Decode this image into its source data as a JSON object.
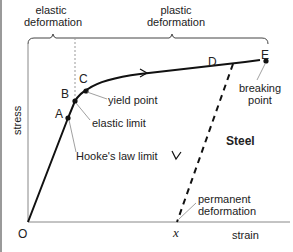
{
  "diagram": {
    "material_label": "Steel",
    "axes": {
      "x_label": "strain",
      "y_label": "stress",
      "origin_label": "O",
      "permanent_strain_label": "x"
    },
    "regions": [
      {
        "label_line1": "elastic",
        "label_line2": "deformation"
      },
      {
        "label_line1": "plastic",
        "label_line2": "deformation"
      }
    ],
    "points": [
      {
        "id": "A",
        "annotation": "Hooke's law limit"
      },
      {
        "id": "B",
        "annotation": "elastic limit"
      },
      {
        "id": "C",
        "annotation": "yield point"
      },
      {
        "id": "D",
        "annotation": ""
      },
      {
        "id": "E",
        "annotation_line1": "breaking",
        "annotation_line2": "point"
      }
    ],
    "unloading_annotation_line1": "permanent",
    "unloading_annotation_line2": "deformation"
  }
}
